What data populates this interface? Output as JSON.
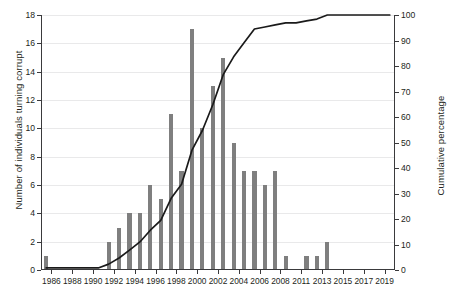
{
  "chart_data": {
    "type": "bar",
    "title": "",
    "subtitle": "",
    "xlabel": "",
    "ylabel": "Number of individuals turning corrupt",
    "y2label": "Cumulative percentage",
    "grid": true,
    "legend": null,
    "ylim": [
      0,
      18
    ],
    "y2lim": [
      0,
      100
    ],
    "yticks": [
      0,
      2,
      4,
      6,
      8,
      10,
      12,
      14,
      16,
      18
    ],
    "y2ticks": [
      0,
      10,
      20,
      30,
      40,
      50,
      60,
      70,
      80,
      90,
      100
    ],
    "xtick_labels": [
      "1986",
      "1988",
      "1990",
      "1992",
      "1994",
      "1996",
      "1998",
      "2000",
      "2002",
      "2004",
      "2006",
      "2008",
      "2011",
      "2013",
      "2015",
      "2017",
      "2019"
    ],
    "categories": [
      "1986",
      "1987",
      "1988",
      "1989",
      "1990",
      "1991",
      "1992",
      "1993",
      "1994",
      "1995",
      "1996",
      "1997",
      "1998",
      "1999",
      "2000",
      "2001",
      "2002",
      "2003",
      "2004",
      "2005",
      "2006",
      "2007",
      "2008",
      "2009",
      "2010",
      "2011",
      "2012",
      "2013",
      "2014",
      "2015",
      "2016",
      "2017",
      "2018",
      "2019"
    ],
    "series": [
      {
        "name": "Number of individuals turning corrupt",
        "type": "bar",
        "axis": "left",
        "color": "#7f7f7f",
        "values": [
          1,
          0,
          0,
          0,
          0,
          0,
          2,
          3,
          4,
          4,
          6,
          5,
          11,
          7,
          17,
          10,
          13,
          15,
          9,
          7,
          7,
          6,
          7,
          1,
          0,
          1,
          1,
          2,
          0,
          0,
          0,
          0,
          0,
          0
        ]
      },
      {
        "name": "Cumulative percentage",
        "type": "line",
        "axis": "right",
        "color": "#1a1a1a",
        "values": [
          0.8,
          0.8,
          0.8,
          0.8,
          0.8,
          0.8,
          2.3,
          4.7,
          7.8,
          11.0,
          15.6,
          19.5,
          28.1,
          33.6,
          47.0,
          54.7,
          64.8,
          76.6,
          83.6,
          89.1,
          94.5,
          95.3,
          96.1,
          96.9,
          96.9,
          97.7,
          98.4,
          100.0,
          100.0,
          100.0,
          100.0,
          100.0,
          100.0,
          100.0
        ]
      }
    ]
  },
  "colors": {
    "bar": "#7f7f7f",
    "line": "#1a1a1a",
    "axis": "#3a3a3c",
    "grid": "#e9e9ea",
    "text": "#231f20",
    "background": "#ffffff"
  }
}
